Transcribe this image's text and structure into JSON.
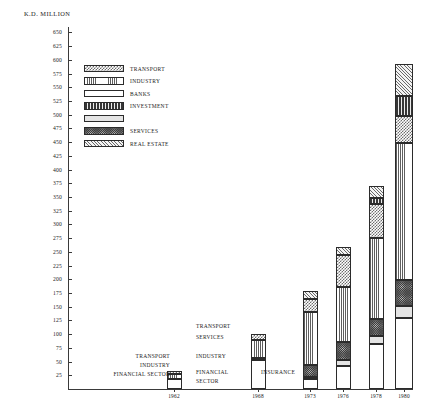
{
  "chart": {
    "axis_title": "K.D. MILLION",
    "ylabel": "K.D. MILLION"
  },
  "yaxis": {
    "ticks": [
      650,
      625,
      600,
      575,
      550,
      525,
      500,
      475,
      450,
      425,
      400,
      375,
      350,
      325,
      300,
      275,
      250,
      225,
      200,
      175,
      150,
      125,
      100,
      75,
      50,
      25
    ]
  },
  "legend": {
    "items": [
      {
        "label": "TRANSPORT",
        "pattern": "checkerboard"
      },
      {
        "label": "INDUSTRY",
        "pattern": "vertical-lines"
      },
      {
        "label": "BANKS",
        "pattern": "horizontal-lines"
      },
      {
        "label": "INVESTMENT",
        "pattern": "dense-vertical"
      },
      {
        "label": "",
        "pattern": "light-stipple"
      },
      {
        "label": "SERVICES",
        "pattern": "dark-stipple"
      },
      {
        "label": "REAL ESTATE",
        "pattern": "diagonal-hatch"
      }
    ]
  },
  "annotations": [
    {
      "text": "TRANSPORT",
      "group": "1962"
    },
    {
      "text": "INDUSTRY",
      "group": "1962"
    },
    {
      "text": "FINANCIAL SECTOR",
      "group": "1962"
    },
    {
      "text": "TRANSPORT",
      "group": "1968"
    },
    {
      "text": "SERVICES",
      "group": "1968"
    },
    {
      "text": "INDUSTRY",
      "group": "1968"
    },
    {
      "text": "FINANCIAL",
      "group": "1968"
    },
    {
      "text": "SECTOR",
      "group": "1968"
    },
    {
      "text": "INSURANCE",
      "group": "1973"
    }
  ],
  "chart_data": {
    "type": "bar",
    "title": "",
    "subtitle": "",
    "xlabel": "",
    "ylabel": "K.D. MILLION",
    "ylim": [
      0,
      660
    ],
    "grid": false,
    "legend_position": "upper-left-inside",
    "stacked": true,
    "categories": [
      "1962",
      "1968",
      "1973",
      "1976",
      "1978",
      "1980"
    ],
    "series": [
      {
        "name": "BANKS",
        "pattern": "horizontal-lines",
        "values": [
          18,
          52,
          18,
          42,
          82,
          130
        ]
      },
      {
        "name": "INSURANCE",
        "pattern": "light-stipple",
        "values": [
          0,
          0,
          4,
          10,
          14,
          22
        ]
      },
      {
        "name": "SERVICES",
        "pattern": "dark-stipple",
        "values": [
          0,
          5,
          22,
          34,
          32,
          46
        ]
      },
      {
        "name": "INDUSTRY",
        "pattern": "vertical-lines",
        "values": [
          10,
          33,
          96,
          100,
          148,
          250
        ]
      },
      {
        "name": "TRANSPORT",
        "pattern": "checkerboard",
        "values": [
          4,
          10,
          24,
          58,
          62,
          50
        ]
      },
      {
        "name": "INVESTMENT",
        "pattern": "dense-vertical",
        "values": [
          0,
          0,
          0,
          0,
          10,
          36
        ]
      },
      {
        "name": "REAL ESTATE",
        "pattern": "diagonal-hatch",
        "values": [
          0,
          0,
          14,
          14,
          22,
          58
        ]
      }
    ],
    "totals": [
      32,
      100,
      178,
      258,
      370,
      592
    ]
  }
}
